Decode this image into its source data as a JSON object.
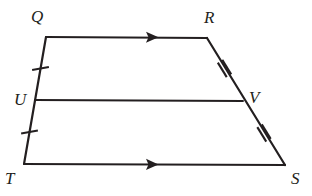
{
  "figure": {
    "name": "trapezoid-qrst-with-midsegment-uv",
    "stroke_color": "#231f20",
    "background_color": "#ffffff",
    "stroke_width": 2.2,
    "width": 312,
    "height": 196
  },
  "points": {
    "Q": {
      "label": "Q",
      "x": 46,
      "y": 37,
      "label_x": 31,
      "label_y": 8
    },
    "R": {
      "label": "R",
      "x": 207,
      "y": 38,
      "label_x": 204,
      "label_y": 9
    },
    "S": {
      "label": "S",
      "x": 285,
      "y": 165,
      "label_x": 291,
      "label_y": 170
    },
    "T": {
      "label": "T",
      "x": 24,
      "y": 164,
      "label_x": 5,
      "label_y": 170
    },
    "U": {
      "label": "U",
      "x": 35,
      "y": 100,
      "label_x": 14,
      "label_y": 91
    },
    "V": {
      "label": "V",
      "x": 243,
      "y": 101,
      "label_x": 249,
      "label_y": 89
    }
  },
  "segments": [
    {
      "name": "segment-QR",
      "from": "Q",
      "to": "R",
      "x1": 46,
      "y1": 37,
      "x2": 207,
      "y2": 38
    },
    {
      "name": "segment-RS",
      "from": "R",
      "to": "S",
      "x1": 207,
      "y1": 38,
      "x2": 285,
      "y2": 165
    },
    {
      "name": "segment-TS",
      "from": "T",
      "to": "S",
      "x1": 24,
      "y1": 164,
      "x2": 285,
      "y2": 165
    },
    {
      "name": "segment-QT",
      "from": "Q",
      "to": "T",
      "x1": 46,
      "y1": 37,
      "x2": 24,
      "y2": 164
    },
    {
      "name": "segment-UV",
      "from": "U",
      "to": "V",
      "x1": 35,
      "y1": 100,
      "x2": 243,
      "y2": 101
    }
  ],
  "arrow_marks": [
    {
      "name": "parallel-arrow-QR",
      "on_segment": "QR",
      "x": 155,
      "y": 37.3,
      "angle": 0.36,
      "direction": "right"
    },
    {
      "name": "parallel-arrow-TS",
      "on_segment": "TS",
      "x": 155,
      "y": 164.5,
      "angle": 0.22,
      "direction": "right"
    }
  ],
  "tick_marks": [
    {
      "name": "tick-QU",
      "on_segment": "QU",
      "count": 1,
      "x": 40.5,
      "y": 68.5,
      "angle": -9.8
    },
    {
      "name": "tick-UT",
      "on_segment": "UT",
      "count": 1,
      "x": 29.5,
      "y": 132,
      "angle": -9.8
    },
    {
      "name": "tick-RV",
      "on_segment": "RV",
      "count": 2,
      "x": 224.5,
      "y": 68.5,
      "angle": 58.4
    },
    {
      "name": "tick-VS",
      "on_segment": "VS",
      "count": 2,
      "x": 264,
      "y": 133,
      "angle": 58.4
    }
  ],
  "geometry_facts": {
    "parallel_sides": "QR and TS",
    "congruent_halves_left": "QU = UT",
    "congruent_halves_right": "RV = VS",
    "midsegment": "UV"
  }
}
